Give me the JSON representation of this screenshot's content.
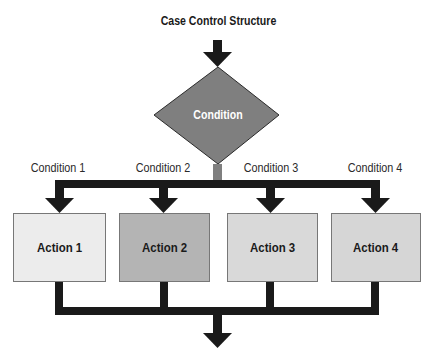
{
  "diagram": {
    "title": "Case Control Structure",
    "decision": {
      "label": "Condition",
      "color": "#7f7f7f"
    },
    "branches": [
      {
        "condition": "Condition 1",
        "action": "Action 1",
        "color": "#ececec"
      },
      {
        "condition": "Condition 2",
        "action": "Action 2",
        "color": "#b4b4b4"
      },
      {
        "condition": "Condition 3",
        "action": "Action 3",
        "color": "#d9d9d9"
      },
      {
        "condition": "Condition 4",
        "action": "Action 4",
        "color": "#d6d6d6"
      }
    ],
    "connector_color": "#1a1a1a",
    "decision_stem_color": "#7f7f7f"
  }
}
